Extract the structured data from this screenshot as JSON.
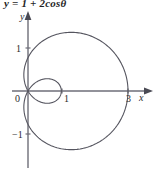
{
  "caption": {
    "text": "y = 1 + 2cosθ"
  },
  "axes": {
    "x_label": "x",
    "y_label": "y",
    "origin_label": "0",
    "x_ticks": [
      {
        "value": 1,
        "label": "1"
      },
      {
        "value": 3,
        "label": "3"
      }
    ],
    "y_ticks": [
      {
        "value": 1,
        "label": "1"
      },
      {
        "value": -1,
        "label": "−1"
      }
    ],
    "axis_color": "#6e6e78",
    "arrow_x": true,
    "arrow_y": true
  },
  "chart_data": {
    "type": "line",
    "title": "y = 1 + 2cosθ",
    "plot_kind": "polar",
    "curve_name": "limacon",
    "equation": "r = 1 + 2cosθ",
    "curve_color": "#55555f",
    "xlabel": "x",
    "ylabel": "y",
    "xlim": [
      -1.2,
      3.6
    ],
    "ylim": [
      -2.0,
      2.0
    ],
    "grid": false,
    "legend": "none",
    "theta_range_deg": [
      0,
      360
    ],
    "r_formula": {
      "a": 1,
      "b": 2,
      "trig": "cos"
    },
    "features": {
      "max_x": 3,
      "min_x": -1,
      "inner_loop_x_extent": 1,
      "y_axis_crossing": 1,
      "max_y": 1.76,
      "min_y": -1.76,
      "inner_loop_theta_deg": [
        120,
        240
      ]
    },
    "x": [
      0,
      15,
      30,
      45,
      60,
      75,
      90,
      105,
      120,
      135,
      150,
      165,
      180,
      195,
      210,
      225,
      240,
      255,
      270,
      285,
      300,
      315,
      330,
      345,
      360
    ],
    "series": [
      {
        "name": "r = 1 + 2cosθ",
        "values": [
          3.0,
          2.932,
          2.732,
          2.414,
          2.0,
          1.518,
          1.0,
          0.482,
          0.0,
          -0.414,
          -0.732,
          -0.932,
          -1.0,
          -0.932,
          -0.732,
          -0.414,
          0.0,
          0.482,
          1.0,
          1.518,
          2.0,
          2.414,
          2.732,
          2.932,
          3.0
        ]
      }
    ]
  }
}
